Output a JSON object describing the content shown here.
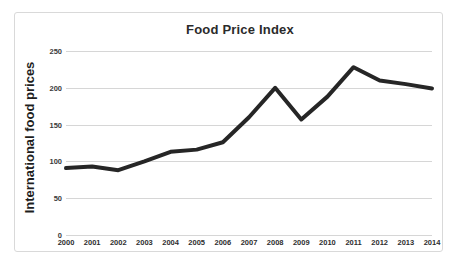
{
  "chart_data": {
    "type": "line",
    "title": "Food Price Index",
    "xlabel": "",
    "ylabel": "International food prices",
    "categories": [
      "2000",
      "2001",
      "2002",
      "2003",
      "2004",
      "2005",
      "2006",
      "2007",
      "2008",
      "2009",
      "2010",
      "2011",
      "2012",
      "2013",
      "2014"
    ],
    "values": [
      91,
      93,
      88,
      100,
      113,
      116,
      126,
      160,
      200,
      157,
      188,
      228,
      210,
      205,
      199
    ],
    "series": [
      {
        "name": "International food prices",
        "values": [
          91,
          93,
          88,
          100,
          113,
          116,
          126,
          160,
          200,
          157,
          188,
          228,
          210,
          205,
          199
        ]
      }
    ],
    "ylim": [
      0,
      250
    ],
    "yticks": [
      0,
      50,
      100,
      150,
      200,
      250
    ],
    "ytick_labels": [
      "0",
      "50",
      "100",
      "150",
      "200",
      "250"
    ],
    "grid": true,
    "grid_axis": "y",
    "legend": false,
    "legend_position": "none",
    "line_color": "#262626",
    "line_width": 4,
    "grid_color": "#d6d6d6",
    "plot_background": "#ffffff",
    "frame_border_color": "#d9d9d9",
    "title_color": "#2b2b2b",
    "tick_label_color": "#3a3a3a"
  }
}
